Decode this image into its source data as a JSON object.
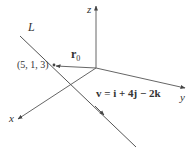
{
  "diagram": {
    "type": "3d-line-vector-diagram",
    "axes": {
      "x": {
        "label": "x"
      },
      "y": {
        "label": "y"
      },
      "z": {
        "label": "z"
      }
    },
    "line": {
      "label": "L"
    },
    "point": {
      "label": "(5, 1, 3)"
    },
    "position_vector": {
      "label_main": "r",
      "label_sub": "0"
    },
    "direction_vector": {
      "label": "v = i + 4j − 2k"
    },
    "colors": {
      "line": "#555555",
      "text": "#333333",
      "background": "#ffffff"
    }
  }
}
